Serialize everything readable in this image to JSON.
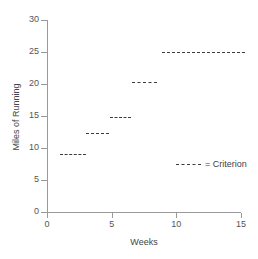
{
  "chart_data": {
    "type": "line",
    "title": "",
    "xlabel": "Weeks",
    "ylabel": "Miles of Running",
    "xlim": [
      0,
      15
    ],
    "ylim": [
      0,
      30
    ],
    "xticks": [
      0,
      5,
      10,
      15
    ],
    "yticks": [
      0,
      5,
      10,
      15,
      20,
      25,
      30
    ],
    "grid": false,
    "legend": {
      "position": "inside-lower-right",
      "entries": [
        {
          "label": "= Criterion",
          "style": "dashed",
          "color": "#3b3b3b"
        }
      ]
    },
    "series": [
      {
        "name": "Criterion",
        "style": "dashed",
        "color": "#3b3b3b",
        "type": "step",
        "segments": [
          {
            "x_start": 1.0,
            "x_end": 3.0,
            "y": 9.0
          },
          {
            "x_start": 3.0,
            "x_end": 4.8,
            "y": 12.3
          },
          {
            "x_start": 4.9,
            "x_end": 6.5,
            "y": 14.8
          },
          {
            "x_start": 6.6,
            "x_end": 8.5,
            "y": 20.3
          },
          {
            "x_start": 8.9,
            "x_end": 15.3,
            "y": 25.0
          }
        ]
      }
    ]
  },
  "axes": {
    "y_tick_labels": [
      "30",
      "25",
      "20",
      "15",
      "10",
      "5",
      "0"
    ],
    "x_tick_labels": [
      "0",
      "5",
      "10",
      "15"
    ],
    "x_title": "Weeks",
    "y_title": "Miles of Running"
  },
  "legend": {
    "criterion_label": "= Criterion"
  },
  "colors": {
    "axis": "#9a9a9a",
    "data": "#3b3b3b",
    "text": "#444444",
    "background": "#ffffff"
  }
}
